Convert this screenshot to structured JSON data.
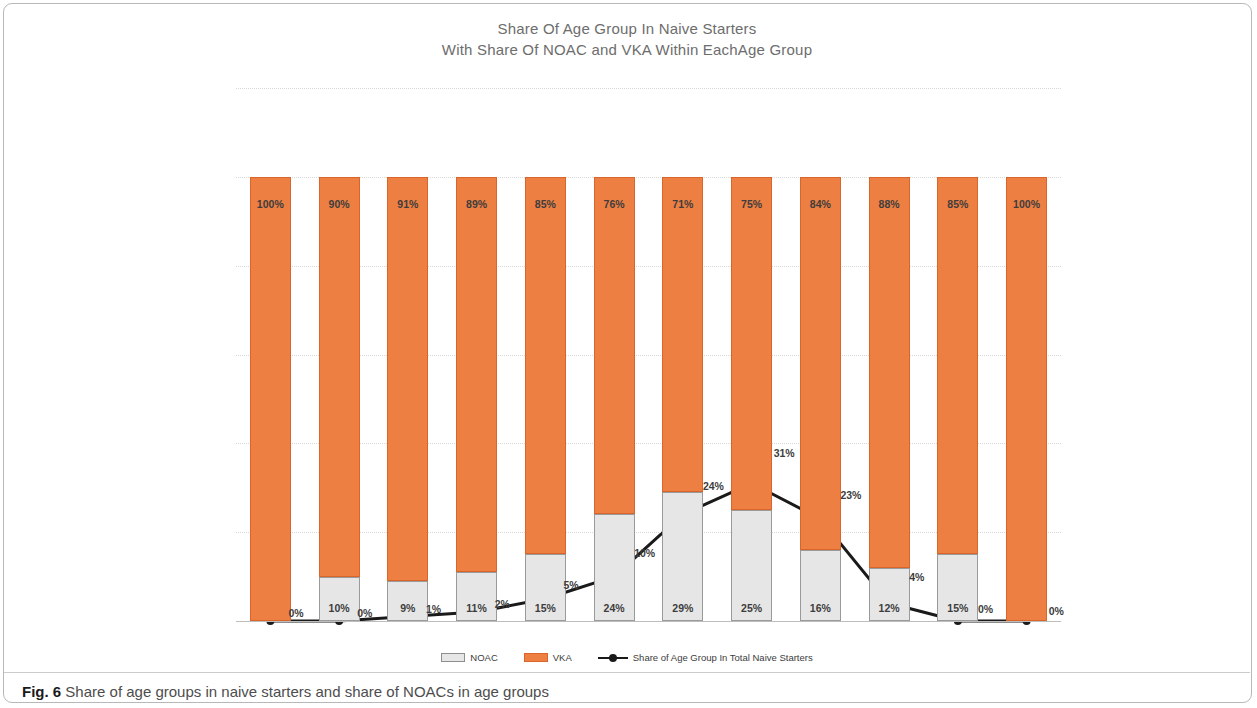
{
  "figure": {
    "number_label": "Fig. 6",
    "caption": "Share of age groups in naive starters and share of NOACs in age groups"
  },
  "chart_data": {
    "type": "bar",
    "title": "Share Of Age Group In Naive Starters",
    "subtitle": "With Share Of NOAC and VKA Within EachAge Group",
    "xlabel": "",
    "ylabel": "",
    "ylim": [
      0,
      120
    ],
    "ytick_labels": [
      "0%",
      "20%",
      "40%",
      "60%",
      "80%",
      "100%",
      "120%"
    ],
    "ytick_values": [
      0,
      20,
      40,
      60,
      80,
      100,
      120
    ],
    "grid": true,
    "legend_position": "bottom",
    "stacked": true,
    "categories": [
      "0-9",
      "10-19",
      "20-29",
      "30-39",
      "40-49",
      "50-59",
      "60-69",
      "70-79",
      "80-89",
      "90-99",
      "100-109",
      "110-119"
    ],
    "series": [
      {
        "name": "NOAC",
        "type": "bar",
        "color": "#e6e6e6",
        "border_color": "#9a9a9a",
        "values": [
          0,
          10,
          9,
          11,
          15,
          24,
          29,
          25,
          16,
          12,
          15,
          0
        ],
        "labels": [
          "",
          "10%",
          "9%",
          "11%",
          "15%",
          "24%",
          "29%",
          "25%",
          "16%",
          "12%",
          "15%",
          ""
        ]
      },
      {
        "name": "VKA",
        "type": "bar",
        "color": "#ee7f42",
        "border_color": "#d9652a",
        "values": [
          100,
          90,
          91,
          89,
          85,
          76,
          71,
          75,
          84,
          88,
          85,
          100
        ],
        "labels": [
          "100%",
          "90%",
          "91%",
          "89%",
          "85%",
          "76%",
          "71%",
          "75%",
          "84%",
          "88%",
          "85%",
          "100%"
        ]
      },
      {
        "name": "Share of Age Group In Total Naive Starters",
        "type": "line",
        "color": "#1a1a1a",
        "values": [
          0,
          0,
          1,
          2,
          5,
          10,
          24,
          31,
          23,
          4,
          0,
          0
        ],
        "labels": [
          "0%",
          "0%",
          "1%",
          "2%",
          "5%",
          "10%",
          "24%",
          "31%",
          "23%",
          "4%",
          "0%",
          "0%"
        ]
      }
    ]
  },
  "legend": {
    "items": [
      {
        "label": "NOAC",
        "swatch": "noac-swatch"
      },
      {
        "label": "VKA",
        "swatch": "vka-swatch"
      },
      {
        "label": "Share of Age Group In Total Naive Starters",
        "swatch": "line-marker-swatch"
      }
    ]
  },
  "colors": {
    "vka": "#ee7f42",
    "noac": "#e6e6e6",
    "line": "#1a1a1a",
    "title_text": "#6d6d6d",
    "frame_border": "#b8b8b8"
  }
}
